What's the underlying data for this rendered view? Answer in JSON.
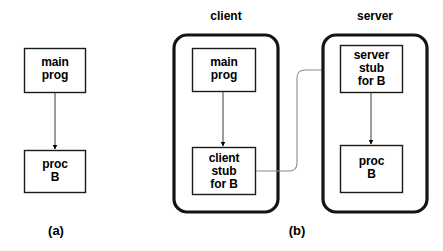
{
  "figure": {
    "background_color": "#ffffff",
    "ink_color": "#000000",
    "thin_line_color": "#808080"
  },
  "panel_a": {
    "caption": "(a)",
    "boxes": [
      {
        "id": "a-main-prog",
        "label": "main\nprog"
      },
      {
        "id": "a-proc-b",
        "label": "proc\nB"
      }
    ],
    "arrows": [
      {
        "id": "a-call-arrow",
        "from": "a-main-prog",
        "to": "a-proc-b"
      }
    ]
  },
  "panel_b": {
    "caption": "(b)",
    "machines": [
      {
        "id": "client-machine",
        "title": "client",
        "boxes": [
          {
            "id": "b-main-prog",
            "label": "main\nprog"
          },
          {
            "id": "b-client-stub",
            "label": "client\nstub\nfor B"
          }
        ]
      },
      {
        "id": "server-machine",
        "title": "server",
        "boxes": [
          {
            "id": "b-server-stub",
            "label": "server\nstub\nfor B"
          },
          {
            "id": "b-proc-b",
            "label": "proc\nB"
          }
        ]
      }
    ],
    "arrows": [
      {
        "id": "b-main-to-client-stub",
        "from": "b-main-prog",
        "to": "b-client-stub"
      },
      {
        "id": "b-network-link",
        "from": "b-client-stub",
        "to": "b-server-stub"
      },
      {
        "id": "b-server-stub-to-proc",
        "from": "b-server-stub",
        "to": "b-proc-b"
      }
    ]
  }
}
